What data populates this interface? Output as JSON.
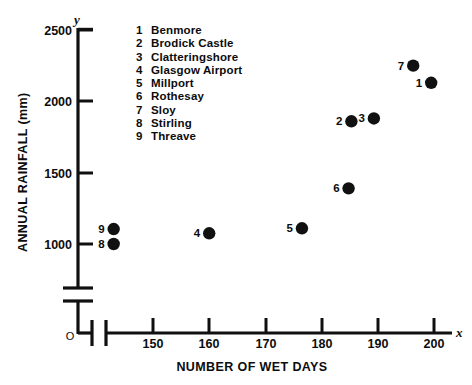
{
  "chart_data": {
    "type": "scatter",
    "title": "",
    "xlabel": "NUMBER OF WET DAYS",
    "ylabel": "ANNUAL RAINFALL (mm)",
    "x_axis_letter": "x",
    "y_axis_letter": "y",
    "origin_label": "O",
    "xlim": [
      141,
      203
    ],
    "ylim": [
      950,
      2500
    ],
    "xticks": [
      150,
      160,
      170,
      180,
      190,
      200
    ],
    "xtick_labels": [
      "150",
      "160",
      "170",
      "180",
      "190",
      "200"
    ],
    "yticks": [
      1000,
      1500,
      2000,
      2500
    ],
    "ytick_labels": [
      "1000",
      "1500",
      "2000",
      "2500"
    ],
    "grid": false,
    "legend_position": "inside-top-left",
    "x_axis_break": true,
    "y_axis_break": true,
    "points": [
      {
        "key": "1",
        "name": "Benmore",
        "x": 199.5,
        "y": 2130,
        "label_side": "left"
      },
      {
        "key": "2",
        "name": "Brodick Castle",
        "x": 185.3,
        "y": 1860,
        "label_side": "left"
      },
      {
        "key": "3",
        "name": "Clatteringshore",
        "x": 189.3,
        "y": 1880,
        "label_side": "left"
      },
      {
        "key": "4",
        "name": "Glasgow Airport",
        "x": 160.0,
        "y": 1075,
        "label_side": "left"
      },
      {
        "key": "5",
        "name": "Millport",
        "x": 176.5,
        "y": 1110,
        "label_side": "left"
      },
      {
        "key": "6",
        "name": "Rothesay",
        "x": 184.8,
        "y": 1390,
        "label_side": "left"
      },
      {
        "key": "7",
        "name": "Sloy",
        "x": 196.3,
        "y": 2250,
        "label_side": "left"
      },
      {
        "key": "8",
        "name": "Stirling",
        "x": 143.0,
        "y": 1000,
        "label_side": "left"
      },
      {
        "key": "9",
        "name": "Threave",
        "x": 143.0,
        "y": 1105,
        "label_side": "left"
      }
    ]
  },
  "legend": {
    "items": [
      {
        "key": "1",
        "name": "Benmore"
      },
      {
        "key": "2",
        "name": "Brodick Castle"
      },
      {
        "key": "3",
        "name": "Clatteringshore"
      },
      {
        "key": "4",
        "name": "Glasgow Airport"
      },
      {
        "key": "5",
        "name": "Millport"
      },
      {
        "key": "6",
        "name": "Rothesay"
      },
      {
        "key": "7",
        "name": "Sloy"
      },
      {
        "key": "8",
        "name": "Stirling"
      },
      {
        "key": "9",
        "name": "Threave"
      }
    ]
  },
  "colors": {
    "ink": "#101010",
    "marker": "#111111",
    "background": "#ffffff"
  }
}
